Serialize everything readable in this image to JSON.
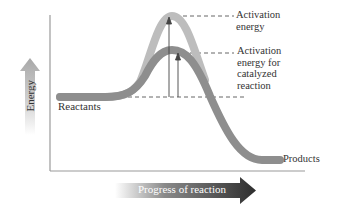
{
  "diagram": {
    "y_axis_label": "Energy",
    "x_axis_label": "Progress of reaction",
    "labels": {
      "reactants": "Reactants",
      "products": "Products",
      "activation_energy": [
        "Activation",
        "energy"
      ],
      "activation_energy_catalyzed": [
        "Activation",
        "energy for",
        "catalyzed",
        "reaction"
      ]
    },
    "curves": [
      {
        "name": "uncatalyzed",
        "color": "#bdbdbd"
      },
      {
        "name": "catalyzed",
        "color": "#8e8e8e"
      }
    ],
    "colors": {
      "axis": "#999999",
      "dashed": "#555555",
      "text": "#333333",
      "arrow_dark": "#3a3a3a"
    }
  }
}
